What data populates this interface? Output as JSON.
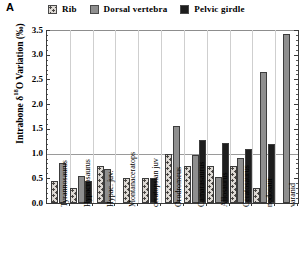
{
  "panel": {
    "letter": "A"
  },
  "legend": {
    "position": "top",
    "items": [
      {
        "label": "Rib",
        "swatch": "rib-pattern-swatch",
        "color": "#ddd9d4"
      },
      {
        "label": "Dorsal vertebra",
        "swatch": "dorsal-vertebra-swatch",
        "color": "#8f8f8f"
      },
      {
        "label": "Pelvic girdle",
        "swatch": "pelvic-girdle-swatch",
        "color": "#1d1d1d"
      }
    ]
  },
  "axes": {
    "y_label_prefix": "Intrabone ",
    "y_label_delta": "δ",
    "y_label_sup": "18",
    "y_label_suffix": "O Variation (‰)",
    "y_ticks": [
      "0.0",
      "0.5",
      "1.0",
      "1.5",
      "2.0",
      "2.5",
      "3.0",
      "3.5"
    ],
    "y_min": 0.0,
    "y_max": 3.5
  },
  "chart_data": {
    "type": "bar",
    "title": "",
    "xlabel": "",
    "ylabel": "Intrabone δ18O Variation (‰)",
    "ylim": [
      0.0,
      3.5
    ],
    "grid": "vertical category separators plus horizontal reference line at 1.0",
    "reference_line": 1.0,
    "legend_position": "top",
    "categories": [
      "Tyrannosaurus",
      "Hypacrosaurus",
      "Hypac. juv.",
      "Montanaceratops",
      "ceratopsian juv",
      "Orodromeus",
      "Camarasaurus",
      "Allosaurus",
      "Ceratosaurus",
      "nodosaur",
      "varanid"
    ],
    "series": [
      {
        "name": "Rib",
        "color": "#ddd9d4",
        "values": [
          0.45,
          0.3,
          0.75,
          0.5,
          0.5,
          1.0,
          0.75,
          0.75,
          0.75,
          0.3,
          null
        ]
      },
      {
        "name": "Dorsal vertebra",
        "color": "#8f8f8f",
        "values": [
          0.8,
          0.55,
          0.68,
          null,
          null,
          1.55,
          0.98,
          0.52,
          0.92,
          2.65,
          3.42
        ]
      },
      {
        "name": "Pelvic girdle",
        "color": "#1d1d1d",
        "values": [
          null,
          0.45,
          null,
          null,
          0.5,
          null,
          1.28,
          1.22,
          1.1,
          1.2,
          null
        ]
      }
    ]
  }
}
